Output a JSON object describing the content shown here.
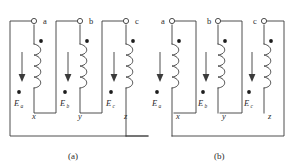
{
  "figure": {
    "width": 290,
    "height": 166,
    "background": "#ffffff",
    "line_color": "#3b3b3b",
    "text_color": "#2b2b2b",
    "dot_color": "#1d1d1d"
  },
  "captions": [
    {
      "id": "caption-a",
      "text": "(a)",
      "x": 68,
      "y": 158
    },
    {
      "id": "caption-b",
      "text": "(b)",
      "x": 214,
      "y": 158
    }
  ],
  "panels": [
    {
      "id": "panel-a",
      "caption": "(a)",
      "terminal_label_side": "right",
      "terminals": [
        {
          "name": "a",
          "label": "a",
          "ring_x": 34,
          "ring_y": 21,
          "label_x": 43,
          "label_y": 24
        },
        {
          "name": "b",
          "label": "b",
          "ring_x": 80,
          "ring_y": 21,
          "label_x": 89,
          "label_y": 24
        },
        {
          "name": "c",
          "label": "c",
          "ring_x": 126,
          "ring_y": 21,
          "label_x": 135,
          "label_y": 24
        }
      ],
      "coils": [
        {
          "name": "coil-a",
          "x": 34,
          "top": 44,
          "bottom": 88
        },
        {
          "name": "coil-b",
          "x": 80,
          "top": 44,
          "bottom": 88
        },
        {
          "name": "coil-c",
          "x": 126,
          "top": 44,
          "bottom": 88
        }
      ],
      "polarity_dots": [
        {
          "name": "dot-coil-a-top",
          "x": 41,
          "y": 41
        },
        {
          "name": "dot-coil-b-top",
          "x": 87,
          "y": 41
        },
        {
          "name": "dot-coil-c-top",
          "x": 133,
          "y": 41
        },
        {
          "name": "dot-emf-a",
          "x": 19,
          "y": 92
        },
        {
          "name": "dot-emf-b",
          "x": 65,
          "y": 92
        },
        {
          "name": "dot-emf-c",
          "x": 111,
          "y": 92
        }
      ],
      "arrows": [
        {
          "name": "arrow-a",
          "x": 22,
          "y1": 52,
          "y2": 80
        },
        {
          "name": "arrow-b",
          "x": 68,
          "y1": 52,
          "y2": 80
        },
        {
          "name": "arrow-c",
          "x": 114,
          "y1": 52,
          "y2": 80
        }
      ],
      "emf_labels": [
        {
          "name": "emf-a",
          "base": "E",
          "sub": "a",
          "x": 14,
          "y": 106
        },
        {
          "name": "emf-b",
          "base": "E",
          "sub": "b",
          "x": 60,
          "y": 106
        },
        {
          "name": "emf-c",
          "base": "E",
          "sub": "c",
          "x": 106,
          "y": 106
        }
      ],
      "lower_terminals": [
        {
          "name": "x",
          "label": "x",
          "x": 32,
          "y": 117
        },
        {
          "name": "y",
          "label": "y",
          "x": 78,
          "y": 117
        },
        {
          "name": "z",
          "label": "z",
          "x": 124,
          "y": 117
        }
      ]
    },
    {
      "id": "panel-b",
      "caption": "(b)",
      "terminal_label_side": "left",
      "terminals": [
        {
          "name": "a",
          "label": "a",
          "ring_x": 172,
          "ring_y": 21,
          "label_x": 161,
          "label_y": 24
        },
        {
          "name": "b",
          "label": "b",
          "ring_x": 218,
          "ring_y": 21,
          "label_x": 207,
          "label_y": 24
        },
        {
          "name": "c",
          "label": "c",
          "ring_x": 264,
          "ring_y": 21,
          "label_x": 253,
          "label_y": 24
        }
      ],
      "coils": [
        {
          "name": "coil-a",
          "x": 172,
          "top": 44,
          "bottom": 88
        },
        {
          "name": "coil-b",
          "x": 218,
          "top": 44,
          "bottom": 88
        },
        {
          "name": "coil-c",
          "x": 264,
          "top": 44,
          "bottom": 88
        }
      ],
      "polarity_dots": [
        {
          "name": "dot-coil-a-top",
          "x": 179,
          "y": 41
        },
        {
          "name": "dot-coil-b-top",
          "x": 225,
          "y": 41
        },
        {
          "name": "dot-coil-c-top",
          "x": 271,
          "y": 41
        },
        {
          "name": "dot-emf-a",
          "x": 157,
          "y": 92
        },
        {
          "name": "dot-emf-b",
          "x": 203,
          "y": 92
        },
        {
          "name": "dot-emf-c",
          "x": 249,
          "y": 92
        }
      ],
      "arrows": [
        {
          "name": "arrow-a",
          "x": 160,
          "y1": 52,
          "y2": 80
        },
        {
          "name": "arrow-b",
          "x": 206,
          "y1": 52,
          "y2": 80
        },
        {
          "name": "arrow-c",
          "x": 252,
          "y1": 52,
          "y2": 80
        }
      ],
      "emf_labels": [
        {
          "name": "emf-a",
          "base": "E",
          "sub": "a",
          "x": 152,
          "y": 106
        },
        {
          "name": "emf-b",
          "base": "E",
          "sub": "b",
          "x": 198,
          "y": 106
        },
        {
          "name": "emf-c",
          "base": "E",
          "sub": "c",
          "x": 244,
          "y": 106
        }
      ],
      "lower_terminals": [
        {
          "name": "x",
          "label": "x",
          "x": 176,
          "y": 117
        },
        {
          "name": "y",
          "label": "y",
          "x": 222,
          "y": 117
        },
        {
          "name": "z",
          "label": "z",
          "x": 268,
          "y": 117
        }
      ]
    }
  ],
  "subscripts": {
    "a": "a",
    "b": "b",
    "c": "c"
  },
  "diagram_meta": {
    "type": "three-phase-winding-connection",
    "panel_a_connection": "delta",
    "panel_b_connection": "wye-delta-alternate"
  }
}
